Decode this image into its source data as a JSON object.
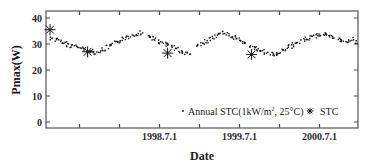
{
  "chart_data": {
    "type": "scatter",
    "title": "",
    "xlabel": "Date",
    "ylabel": "Pmax(W)",
    "ylim": [
      0,
      40
    ],
    "yticks": [
      0,
      10,
      20,
      30,
      40
    ],
    "xtick_labels": [
      "1998.7.1",
      "1999.7.1",
      "2000.7.1"
    ],
    "xtick_positions_years": [
      1997.5,
      1998.0,
      1998.5,
      1999.0,
      1999.5,
      2000.0,
      2000.5
    ],
    "xlim_years": [
      1997.08,
      2000.98
    ],
    "grid": false,
    "legend_position": "lower right inside",
    "legend": [
      {
        "marker": "dot",
        "label_main": "Annual STC(1kW/m",
        "label_sup": "2",
        "label_tail": ", 25°C)"
      },
      {
        "marker": "asterisk",
        "label_main": "STC"
      }
    ],
    "series": [
      {
        "name": "Annual STC(1kW/m2, 25°C)",
        "marker": "dot",
        "segments": [
          {
            "x": [
              1997.15,
              1997.2,
              1997.25,
              1997.3,
              1997.35,
              1997.4,
              1997.45,
              1997.5,
              1997.55,
              1997.6,
              1997.65,
              1997.7,
              1997.75,
              1997.8,
              1997.85,
              1997.9,
              1997.95,
              1998.0,
              1998.05,
              1998.1,
              1998.15,
              1998.2,
              1998.25
            ],
            "y": [
              32.5,
              31.8,
              31.2,
              30.6,
              30.0,
              29.6,
              29.2,
              28.8,
              28.3,
              27.8,
              27.4,
              27.1,
              27.5,
              28.2,
              29.0,
              29.8,
              30.6,
              31.4,
              32.2,
              33.0,
              33.6,
              34.2,
              34.6
            ]
          },
          {
            "x": [
              1998.35,
              1998.4,
              1998.45,
              1998.5,
              1998.55,
              1998.6,
              1998.65,
              1998.7,
              1998.75,
              1998.8,
              1998.85
            ],
            "y": [
              33.4,
              32.6,
              31.8,
              31.0,
              30.4,
              29.8,
              29.0,
              28.2,
              27.6,
              27.0,
              26.6
            ]
          },
          {
            "x": [
              1998.98,
              1999.03,
              1999.08,
              1999.13,
              1999.18,
              1999.23,
              1999.28,
              1999.33,
              1999.38,
              1999.43,
              1999.48,
              1999.53,
              1999.58,
              1999.63,
              1999.68,
              1999.73,
              1999.78,
              1999.83,
              1999.88,
              1999.93,
              1999.98,
              2000.03,
              2000.08,
              2000.13,
              2000.18,
              2000.23,
              2000.28,
              2000.33,
              2000.38,
              2000.43,
              2000.48,
              2000.53,
              2000.58,
              2000.63,
              2000.68,
              2000.73,
              2000.78,
              2000.83,
              2000.88,
              2000.93
            ],
            "y": [
              29.8,
              30.6,
              31.4,
              32.2,
              33.0,
              33.8,
              34.4,
              34.0,
              33.4,
              32.8,
              32.0,
              31.2,
              30.4,
              29.6,
              28.8,
              28.0,
              27.4,
              26.8,
              26.4,
              26.2,
              26.8,
              27.6,
              28.4,
              29.2,
              30.0,
              30.8,
              31.6,
              32.4,
              33.0,
              33.4,
              33.8,
              34.0,
              33.6,
              33.0,
              32.6,
              32.0,
              31.6,
              31.4,
              32.0,
              31.2
            ]
          }
        ]
      },
      {
        "name": "STC",
        "marker": "asterisk",
        "x": [
          1997.13,
          1997.6,
          1998.6,
          1999.65
        ],
        "y": [
          35.5,
          27.0,
          26.5,
          26.0
        ]
      }
    ]
  }
}
